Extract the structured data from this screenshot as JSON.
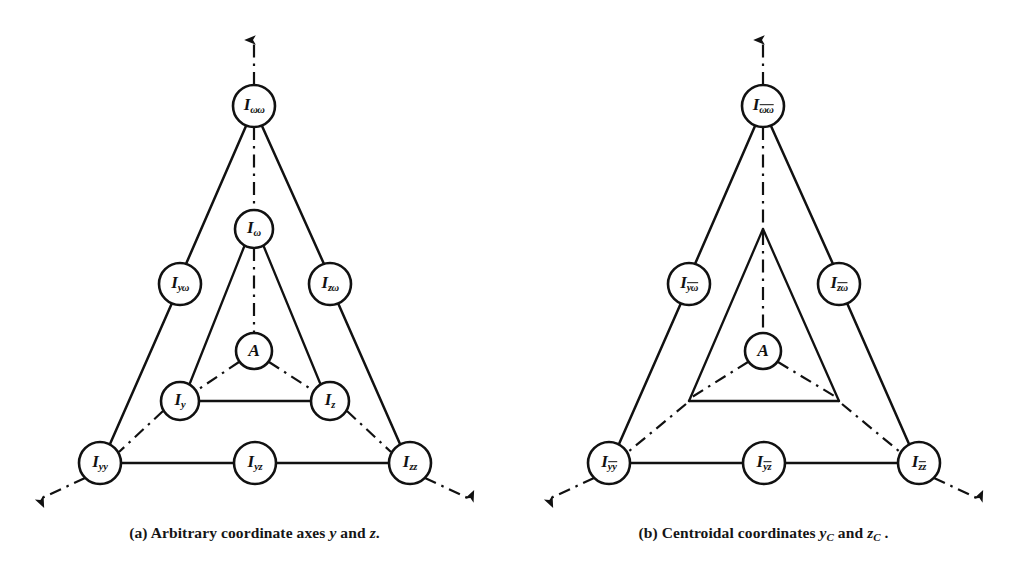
{
  "figure": {
    "kind": "tributary-diagram-pair",
    "ink_color": "#111111",
    "background": "#ffffff"
  },
  "panels": [
    {
      "id": "a",
      "caption_prefix": "(a)",
      "caption_text": "Arbitrary coordinate axes",
      "caption_var1": "y",
      "caption_join": "and",
      "caption_var2": "z",
      "caption_end": ".",
      "nodes": {
        "apex": {
          "base": "I",
          "sub": "ωω",
          "overbar": false
        },
        "left_mid": {
          "base": "I",
          "sub": "yω",
          "overbar": false
        },
        "right_mid": {
          "base": "I",
          "sub": "zω",
          "overbar": false
        },
        "bottom_left": {
          "base": "I",
          "sub": "yy",
          "overbar": false
        },
        "bottom_mid": {
          "base": "I",
          "sub": "yz",
          "overbar": false
        },
        "bottom_right": {
          "base": "I",
          "sub": "zz",
          "overbar": false
        },
        "inner_apex": {
          "base": "I",
          "sub": "ω",
          "overbar": false
        },
        "inner_left": {
          "base": "I",
          "sub": "y",
          "overbar": false
        },
        "inner_right": {
          "base": "I",
          "sub": "z",
          "overbar": false
        },
        "center": {
          "base": "A",
          "sub": "",
          "overbar": false
        }
      },
      "inner_nodes_circled": true
    },
    {
      "id": "b",
      "caption_prefix": "(b)",
      "caption_text": "Centroidal coordinates",
      "caption_var1": "y",
      "caption_var1_sub": "C",
      "caption_join": "and",
      "caption_var2": "z",
      "caption_var2_sub": "C",
      "caption_end": ".",
      "nodes": {
        "apex": {
          "base": "I",
          "sub": "ωω",
          "overbar": true
        },
        "left_mid": {
          "base": "I",
          "sub": "yω",
          "overbar": true
        },
        "right_mid": {
          "base": "I",
          "sub": "zω",
          "overbar": true
        },
        "bottom_left": {
          "base": "I",
          "sub": "yy",
          "overbar": true
        },
        "bottom_mid": {
          "base": "I",
          "sub": "yz",
          "overbar": true
        },
        "bottom_right": {
          "base": "I",
          "sub": "zz",
          "overbar": true
        },
        "center": {
          "base": "A",
          "sub": "",
          "overbar": false
        }
      },
      "inner_nodes_circled": false
    }
  ],
  "geometry": {
    "apex": [
      254,
      106
    ],
    "left_mid": [
      180,
      284
    ],
    "right_mid": [
      330,
      284
    ],
    "bottom_left": [
      100,
      463
    ],
    "bottom_mid": [
      255,
      463
    ],
    "bottom_right": [
      410,
      463
    ],
    "inner_apex": [
      254,
      229
    ],
    "inner_left": [
      180,
      401
    ],
    "inner_right": [
      330,
      401
    ],
    "center": [
      254,
      351
    ],
    "arrow_up_tip": [
      254,
      33
    ],
    "arrow_left_tip": [
      33,
      505
    ],
    "arrow_right_tip": [
      477,
      505
    ],
    "node_radius_outer": 21,
    "node_radius_inner": 19,
    "node_radius_center": 18
  }
}
